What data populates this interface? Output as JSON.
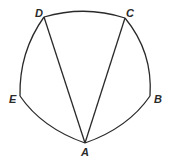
{
  "diagram": {
    "type": "geometry",
    "points": {
      "A": {
        "label": "A",
        "x": 85,
        "y": 143
      },
      "B": {
        "label": "B",
        "x": 150,
        "y": 96
      },
      "C": {
        "label": "C",
        "x": 125,
        "y": 18
      },
      "D": {
        "label": "D",
        "x": 44,
        "y": 17
      },
      "E": {
        "label": "E",
        "x": 20,
        "y": 96
      }
    },
    "segments": [
      "AD",
      "AC"
    ],
    "arcs": [
      "AB",
      "BC",
      "CD",
      "DE",
      "EA"
    ],
    "stroke_color": "#2a2a2a"
  }
}
